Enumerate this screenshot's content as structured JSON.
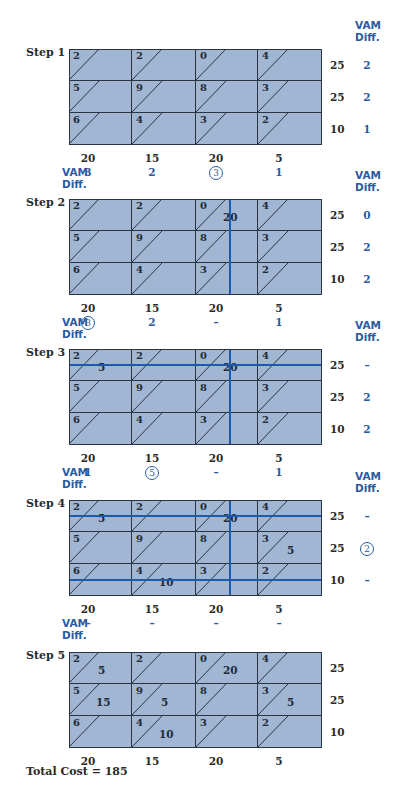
{
  "labels": {
    "vam_line1": "VAM",
    "vam_line2": "Diff.",
    "total_cost": "Total Cost = 185"
  },
  "colors": {
    "cell_fill": "#a0b6d3",
    "grid_line": "#2b3442",
    "strike_line": "#1f5aa8",
    "vam_text": "#2b5aa0"
  },
  "costs": [
    [
      2,
      2,
      0,
      4
    ],
    [
      5,
      9,
      8,
      3
    ],
    [
      6,
      4,
      3,
      2
    ]
  ],
  "supply": [
    "25",
    "25",
    "10"
  ],
  "demand": [
    "20",
    "15",
    "20",
    "5"
  ],
  "steps": [
    {
      "label": "Step 1",
      "top": 49,
      "row_diff": [
        "2",
        "2",
        "1"
      ],
      "row_diff_circled": [
        false,
        false,
        false
      ],
      "col_diff": [
        "3",
        "2",
        "3",
        "1"
      ],
      "col_diff_circled": [
        false,
        false,
        true,
        false
      ],
      "allocations": [],
      "crossed_rows": [],
      "crossed_cols": []
    },
    {
      "label": "Step 2",
      "top": 199,
      "row_diff": [
        "0",
        "2",
        "2"
      ],
      "row_diff_circled": [
        false,
        false,
        false
      ],
      "col_diff": [
        "3",
        "2",
        "–",
        "1"
      ],
      "col_diff_circled": [
        true,
        false,
        false,
        false
      ],
      "allocations": [
        {
          "row": 0,
          "col": 2,
          "value": "20"
        }
      ],
      "crossed_rows": [],
      "crossed_cols": [
        2
      ]
    },
    {
      "label": "Step 3",
      "top": 349,
      "row_diff": [
        "–",
        "2",
        "2"
      ],
      "row_diff_circled": [
        false,
        false,
        false
      ],
      "col_diff": [
        "1",
        "5",
        "–",
        "1"
      ],
      "col_diff_circled": [
        false,
        true,
        false,
        false
      ],
      "allocations": [
        {
          "row": 0,
          "col": 0,
          "value": "5"
        },
        {
          "row": 0,
          "col": 2,
          "value": "20"
        }
      ],
      "crossed_rows": [
        0
      ],
      "crossed_cols": [
        2
      ]
    },
    {
      "label": "Step 4",
      "top": 500,
      "row_diff": [
        "–",
        "2",
        "–"
      ],
      "row_diff_circled": [
        false,
        true,
        false
      ],
      "col_diff": [
        "–",
        "–",
        "–",
        "–"
      ],
      "col_diff_circled": [
        false,
        false,
        false,
        false
      ],
      "allocations": [
        {
          "row": 0,
          "col": 0,
          "value": "5"
        },
        {
          "row": 0,
          "col": 2,
          "value": "20"
        },
        {
          "row": 1,
          "col": 3,
          "value": "5"
        },
        {
          "row": 2,
          "col": 1,
          "value": "10"
        }
      ],
      "crossed_rows": [
        0,
        2
      ],
      "crossed_cols": [
        2
      ]
    },
    {
      "label": "Step 5",
      "top": 652,
      "row_diff": [],
      "row_diff_circled": [],
      "col_diff": [],
      "col_diff_circled": [],
      "allocations": [
        {
          "row": 0,
          "col": 0,
          "value": "5"
        },
        {
          "row": 0,
          "col": 2,
          "value": "20"
        },
        {
          "row": 1,
          "col": 0,
          "value": "15"
        },
        {
          "row": 1,
          "col": 1,
          "value": "5"
        },
        {
          "row": 1,
          "col": 3,
          "value": "5"
        },
        {
          "row": 2,
          "col": 1,
          "value": "10"
        }
      ],
      "crossed_rows": [],
      "crossed_cols": []
    }
  ]
}
